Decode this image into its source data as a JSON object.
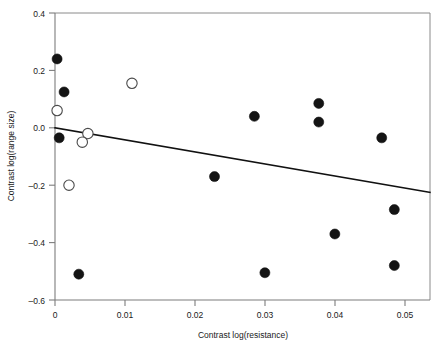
{
  "chart_data": {
    "type": "scatter",
    "title": "",
    "xlabel": "Contrast log(resistance)",
    "ylabel": "Contrast log(range size)",
    "xlim": [
      0,
      0.0536
    ],
    "ylim": [
      -0.6,
      0.4
    ],
    "xticks": [
      0,
      0.01,
      0.02,
      0.03,
      0.04,
      0.05
    ],
    "xticklabels": [
      "0",
      "0.01",
      "0.02",
      "0.03",
      "0.04",
      "0.05"
    ],
    "yticks": [
      -0.6,
      -0.4,
      -0.2,
      0.0,
      0.2,
      0.4
    ],
    "yticklabels": [
      "–0.6",
      "–0.4",
      "–0.2",
      "0.0",
      "0.2",
      "0.4"
    ],
    "grid": false,
    "legend": "none",
    "series": [
      {
        "name": "filled-points",
        "marker": "filled-circle",
        "color": "#141414",
        "points": [
          {
            "x": 0.0003,
            "y": 0.24
          },
          {
            "x": 0.0013,
            "y": 0.125
          },
          {
            "x": 0.0006,
            "y": -0.035
          },
          {
            "x": 0.0034,
            "y": -0.51
          },
          {
            "x": 0.0228,
            "y": -0.17
          },
          {
            "x": 0.0285,
            "y": 0.04
          },
          {
            "x": 0.03,
            "y": -0.505
          },
          {
            "x": 0.0377,
            "y": 0.085
          },
          {
            "x": 0.0377,
            "y": 0.02
          },
          {
            "x": 0.04,
            "y": -0.37
          },
          {
            "x": 0.0467,
            "y": -0.035
          },
          {
            "x": 0.0485,
            "y": -0.285
          },
          {
            "x": 0.0485,
            "y": -0.48
          }
        ]
      },
      {
        "name": "open-points",
        "marker": "open-circle",
        "color": "#ffffff",
        "points": [
          {
            "x": 0.0003,
            "y": 0.06
          },
          {
            "x": 0.011,
            "y": 0.155
          },
          {
            "x": 0.0047,
            "y": -0.02
          },
          {
            "x": 0.0039,
            "y": -0.05
          },
          {
            "x": 0.002,
            "y": -0.2
          }
        ]
      }
    ],
    "fit_line": {
      "name": "regression-line",
      "x0": 0.0,
      "y0": 0.0,
      "x1": 0.0536,
      "y1": -0.225
    }
  }
}
